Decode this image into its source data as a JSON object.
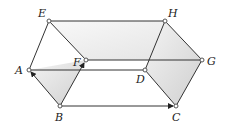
{
  "diagram": {
    "type": "geometric prism",
    "points": {
      "A": {
        "label": "A",
        "x": 29,
        "y": 70
      },
      "B": {
        "label": "B",
        "x": 60,
        "y": 106
      },
      "C": {
        "label": "C",
        "x": 176,
        "y": 106
      },
      "D": {
        "label": "D",
        "x": 145,
        "y": 70
      },
      "E": {
        "label": "E",
        "x": 49,
        "y": 21
      },
      "F": {
        "label": "F",
        "x": 86,
        "y": 60
      },
      "G": {
        "label": "G",
        "x": 202,
        "y": 60
      },
      "H": {
        "label": "H",
        "x": 165,
        "y": 21
      }
    },
    "edges": [
      "E-H",
      "E-A",
      "E-F",
      "H-D",
      "H-G",
      "A-D",
      "F-G",
      "A-B",
      "B-C",
      "F-B",
      "D-C",
      "G-C"
    ],
    "arrows": [
      "B->A",
      "B->C",
      "B->F"
    ],
    "colors": {
      "stroke": "#333333",
      "shade": "#d9d9d9"
    }
  }
}
